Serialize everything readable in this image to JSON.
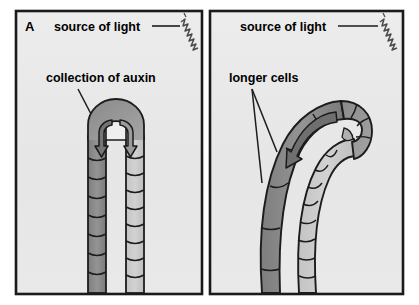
{
  "figure": {
    "background_color": "#ffffff",
    "panel_fill": "#e7e7e7",
    "panel_border_color": "#1a1a1a",
    "stem_dark_color": "#8d8d8d",
    "stem_light_color": "#c9c9c9",
    "outline_color": "#1c1c1c"
  },
  "panels": [
    {
      "id": "panel-a",
      "panel_label": "A",
      "labels": {
        "light": "source of light",
        "auxin": "collection of auxin"
      },
      "icons": {
        "light_ray": "squiggle-light-ray-icon",
        "auxin_flow_left": "auxin-flow-arrow-icon",
        "auxin_flow_right": "auxin-flow-arrow-icon"
      },
      "description": "Straight seedling with hooked tip; auxin collects on the shaded side"
    },
    {
      "id": "panel-b",
      "panel_label": "",
      "labels": {
        "light": "source of light",
        "cells": "longer cells"
      },
      "icons": {
        "light_ray": "squiggle-light-ray-icon",
        "auxin_flow_left": "auxin-flow-arrow-icon"
      },
      "description": "Seedling bent toward the light; cells on the shaded side have elongated"
    }
  ]
}
